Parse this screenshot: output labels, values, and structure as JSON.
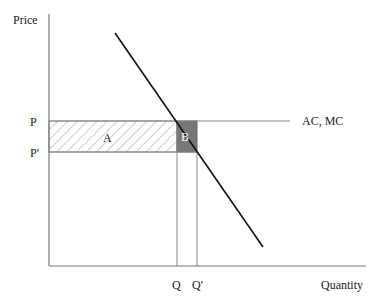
{
  "diagram": {
    "y_axis_label": "Price",
    "x_axis_label": "Quantity",
    "price_labels": {
      "p": "P",
      "p_prime": "P'"
    },
    "quantity_labels": {
      "q": "Q",
      "q_prime": "Q'"
    },
    "cost_line_label": "AC, MC",
    "area_labels": {
      "a": "A",
      "b": "B"
    },
    "colors": {
      "axis": "#777777",
      "demand_line": "#111111",
      "area_b_fill": "#777777",
      "hatch": "#888888"
    }
  }
}
